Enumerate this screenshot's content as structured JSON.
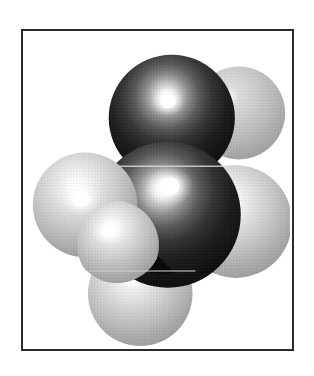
{
  "figure": {
    "kind": "space-filling-molecular-model",
    "caption": "",
    "background_color": "#ffffff",
    "frame": {
      "border_color": "#2b2b2b",
      "border_width_px": 2,
      "x": 21,
      "y": 29,
      "width": 273,
      "height": 322,
      "fill": "#ffffff"
    },
    "palette": {
      "carbon_dark": "#111111",
      "carbon_mid": "#3a3a3a",
      "carbon_highlight": "#ffffff",
      "hydrogen_light": "#c9c9c9",
      "hydrogen_mid": "#a8a8a8",
      "hydrogen_shadow": "#8a8a8a",
      "hydrogen_highlight": "#ffffff",
      "outline": "#2b2b2b"
    },
    "lighting": {
      "key_light_direction": "upper-left-front",
      "specular": "strong-small-hotspot"
    },
    "atoms": [
      {
        "id": "H-upper-right",
        "element": "H",
        "label": "hydrogen",
        "cx": 240,
        "cy": 112,
        "r": 47,
        "shade": "light",
        "z": 0,
        "highlight_cx": 228,
        "highlight_cy": 96
      },
      {
        "id": "H-right",
        "element": "H",
        "label": "hydrogen",
        "cx": 237,
        "cy": 222,
        "r": 57,
        "shade": "light",
        "z": 1,
        "highlight_cx": 224,
        "highlight_cy": 200
      },
      {
        "id": "H-bottom",
        "element": "H",
        "label": "hydrogen",
        "cx": 140,
        "cy": 295,
        "r": 53,
        "shade": "light",
        "z": 2,
        "highlight_cx": 128,
        "highlight_cy": 276
      },
      {
        "id": "C-top",
        "element": "C",
        "label": "carbon",
        "cx": 172,
        "cy": 117,
        "r": 64,
        "shade": "dark",
        "z": 3,
        "highlight_cx": 168,
        "highlight_cy": 100
      },
      {
        "id": "C-center",
        "element": "C",
        "label": "carbon",
        "cx": 168,
        "cy": 215,
        "r": 74,
        "shade": "dark",
        "z": 4,
        "highlight_cx": 170,
        "highlight_cy": 186
      },
      {
        "id": "H-left",
        "element": "H",
        "label": "hydrogen",
        "cx": 84,
        "cy": 205,
        "r": 53,
        "shade": "light",
        "z": 5,
        "highlight_cx": 80,
        "highlight_cy": 199
      },
      {
        "id": "H-lower-left-front",
        "element": "H",
        "label": "hydrogen",
        "cx": 116,
        "cy": 246,
        "r": 45,
        "shade": "light",
        "z": 6,
        "highlight_cx": 108,
        "highlight_cy": 232
      }
    ],
    "summary": {
      "carbon_count": 2,
      "hydrogen_count": 5,
      "description": "CPK space-filling model: two large dark carbon spheres stacked vertically surrounded by light gray hydrogen spheres"
    }
  }
}
